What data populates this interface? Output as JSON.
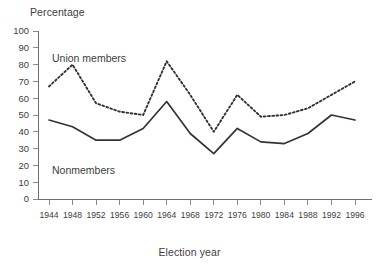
{
  "chart_data": {
    "type": "line",
    "title": "",
    "ylabel": "Percentage",
    "xlabel": "Election year",
    "categories": [
      "1944",
      "1948",
      "1952",
      "1956",
      "1960",
      "1964",
      "1968",
      "1972",
      "1976",
      "1980",
      "1984",
      "1988",
      "1992",
      "1996"
    ],
    "x": [
      1944,
      1948,
      1952,
      1956,
      1960,
      1964,
      1968,
      1972,
      1976,
      1980,
      1984,
      1988,
      1992,
      1996
    ],
    "ylim": [
      0,
      100
    ],
    "ytick_labels": [
      "100",
      "90",
      "80",
      "70",
      "60",
      "50",
      "40",
      "30",
      "20",
      "10",
      "0"
    ],
    "yticks": [
      100,
      90,
      80,
      70,
      60,
      50,
      40,
      30,
      20,
      10,
      0
    ],
    "grid": false,
    "legend": "inline-annotations",
    "series": [
      {
        "name": "Union members",
        "style": "dashed",
        "color": "#333333",
        "annotation": "Union members",
        "values": [
          67,
          80,
          57,
          52,
          50,
          82,
          62,
          40,
          62,
          49,
          50,
          54,
          62,
          70
        ]
      },
      {
        "name": "Nonmembers",
        "style": "solid",
        "color": "#333333",
        "annotation": "Nonmembers",
        "values": [
          47,
          43,
          35,
          35,
          42,
          58,
          39,
          27,
          42,
          34,
          33,
          39,
          50,
          47
        ]
      }
    ]
  },
  "annotations": {
    "union_members": "Union members",
    "nonmembers": "Nonmembers"
  },
  "axes": {
    "y_title": "Percentage",
    "x_title": "Election year"
  }
}
